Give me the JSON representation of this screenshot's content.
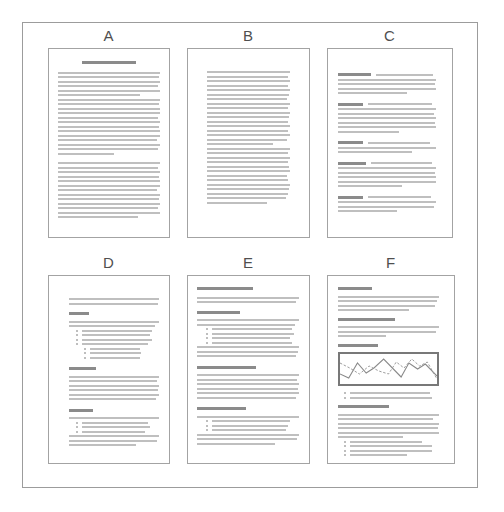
{
  "figure": {
    "description_labels": [
      "A",
      "B",
      "C",
      "D",
      "E",
      "F"
    ]
  },
  "colors": {
    "frame_border": "#9c9c9c",
    "page_border": "#a3a3a3",
    "body_line": "#bfbfbf",
    "heading_bar": "#8b8b8b",
    "bullet_dot": "#a8a8a8",
    "chart_border": "#787878",
    "chart_line_solid": "#8a8a8a",
    "chart_line_dashed": "#9a9a9a",
    "label_text": "#4f4f4f"
  },
  "pages": [
    {
      "label": "A",
      "blocks": [
        {
          "t": "title",
          "w": 52,
          "h": 3,
          "center": true
        },
        {
          "t": "gap",
          "h": 5
        },
        {
          "t": "lines",
          "widths": [
            100,
            99,
            100,
            98,
            100,
            80,
            100,
            99,
            100,
            100,
            98,
            100,
            99,
            100,
            100,
            97,
            100,
            98,
            55
          ]
        },
        {
          "t": "gap",
          "h": 5
        },
        {
          "t": "lines",
          "widths": [
            100,
            98,
            100,
            99,
            100,
            100,
            97,
            100,
            99,
            100,
            98,
            100,
            78
          ]
        }
      ]
    },
    {
      "label": "B",
      "blocks": [
        {
          "t": "lines",
          "widths": [
            100,
            98,
            100,
            97,
            100,
            99,
            96,
            100,
            98,
            100,
            99,
            97,
            100,
            98,
            100,
            96,
            80,
            100,
            98,
            100,
            97,
            99,
            100,
            96,
            98,
            100,
            99,
            97,
            95,
            72
          ]
        }
      ]
    },
    {
      "label": "C",
      "blocks": [
        {
          "t": "runin",
          "head": 34,
          "first": 58,
          "widths": [
            100,
            99,
            100,
            70
          ]
        },
        {
          "t": "gap",
          "h": 6
        },
        {
          "t": "runin",
          "head": 25,
          "first": 66,
          "widths": [
            100,
            98,
            100,
            99,
            100,
            62
          ]
        },
        {
          "t": "gap",
          "h": 6
        },
        {
          "t": "runin",
          "head": 25,
          "first": 64,
          "widths": [
            100,
            76
          ]
        },
        {
          "t": "gap",
          "h": 6
        },
        {
          "t": "runin",
          "head": 29,
          "first": 62,
          "widths": [
            100,
            99,
            100,
            100,
            65
          ]
        },
        {
          "t": "gap",
          "h": 6
        },
        {
          "t": "runin",
          "head": 26,
          "first": 64,
          "widths": [
            100,
            98,
            60
          ]
        }
      ]
    },
    {
      "label": "D",
      "blocks": [
        {
          "t": "lines",
          "widths": [
            100,
            99
          ]
        },
        {
          "t": "gap",
          "h": 5
        },
        {
          "t": "heading",
          "w": 22
        },
        {
          "t": "gap",
          "h": 3
        },
        {
          "t": "lines",
          "widths": [
            100,
            96
          ]
        },
        {
          "t": "bullets",
          "indent": 8,
          "widths": [
            84,
            82,
            84,
            80
          ]
        },
        {
          "t": "bullets",
          "indent": 17,
          "widths": [
            66,
            68,
            66
          ]
        },
        {
          "t": "gap",
          "h": 6
        },
        {
          "t": "heading",
          "w": 30
        },
        {
          "t": "gap",
          "h": 3
        },
        {
          "t": "lines",
          "widths": [
            100,
            98,
            100,
            99,
            100,
            97
          ]
        },
        {
          "t": "gap",
          "h": 6
        },
        {
          "t": "heading",
          "w": 27
        },
        {
          "t": "gap",
          "h": 3
        },
        {
          "t": "lines",
          "widths": [
            100
          ]
        },
        {
          "t": "bullets",
          "indent": 8,
          "widths": [
            80,
            82,
            76
          ]
        },
        {
          "t": "lines",
          "widths": [
            100,
            98,
            74
          ]
        }
      ]
    },
    {
      "label": "E",
      "blocks": [
        {
          "t": "title",
          "w": 55,
          "h": 3
        },
        {
          "t": "gap",
          "h": 4
        },
        {
          "t": "lines",
          "widths": [
            100,
            97
          ]
        },
        {
          "t": "gap",
          "h": 5
        },
        {
          "t": "heading",
          "w": 42
        },
        {
          "t": "gap",
          "h": 3
        },
        {
          "t": "lines",
          "widths": [
            100,
            96
          ]
        },
        {
          "t": "bullets",
          "indent": 9,
          "widths": [
            86,
            88,
            84,
            86
          ]
        },
        {
          "t": "lines",
          "widths": [
            100,
            99,
            97
          ]
        },
        {
          "t": "gap",
          "h": 6
        },
        {
          "t": "heading",
          "w": 58
        },
        {
          "t": "gap",
          "h": 3
        },
        {
          "t": "lines",
          "widths": [
            100,
            98,
            100,
            99,
            100,
            97
          ]
        },
        {
          "t": "gap",
          "h": 6
        },
        {
          "t": "heading",
          "w": 48
        },
        {
          "t": "gap",
          "h": 3
        },
        {
          "t": "lines",
          "widths": [
            100
          ]
        },
        {
          "t": "bullets",
          "indent": 9,
          "widths": [
            84,
            82,
            80
          ]
        },
        {
          "t": "lines",
          "widths": [
            100,
            98,
            76
          ]
        }
      ]
    },
    {
      "label": "F",
      "blocks": [
        {
          "t": "heading",
          "w": 34
        },
        {
          "t": "gap",
          "h": 3
        },
        {
          "t": "lines",
          "widths": [
            100,
            98,
            96,
            70
          ]
        },
        {
          "t": "gap",
          "h": 4
        },
        {
          "t": "heading",
          "w": 56
        },
        {
          "t": "gap",
          "h": 3
        },
        {
          "t": "lines",
          "widths": [
            100,
            97,
            48
          ]
        },
        {
          "t": "gap",
          "h": 4
        },
        {
          "t": "heading",
          "w": 40
        },
        {
          "t": "gap",
          "h": 3
        },
        {
          "t": "chart",
          "solid_points": "0,20 9,24 18,9 27,19 35,14 45,5 55,15 63,23 71,9 80,15 88,10 100,22",
          "dashed_points": "0,9 10,14 20,20 30,12 40,17 50,20 58,8 66,14 74,5 82,12 90,8 100,25"
        },
        {
          "t": "gap",
          "h": 3
        },
        {
          "t": "bullets",
          "indent": 6,
          "widths": [
            84,
            86
          ]
        },
        {
          "t": "gap",
          "h": 4
        },
        {
          "t": "heading",
          "w": 50
        },
        {
          "t": "gap",
          "h": 3
        },
        {
          "t": "lines",
          "widths": [
            100,
            94,
            100,
            99,
            100,
            64
          ]
        },
        {
          "t": "bullets",
          "indent": 6,
          "widths": [
            76,
            86,
            86,
            60
          ]
        }
      ]
    }
  ]
}
